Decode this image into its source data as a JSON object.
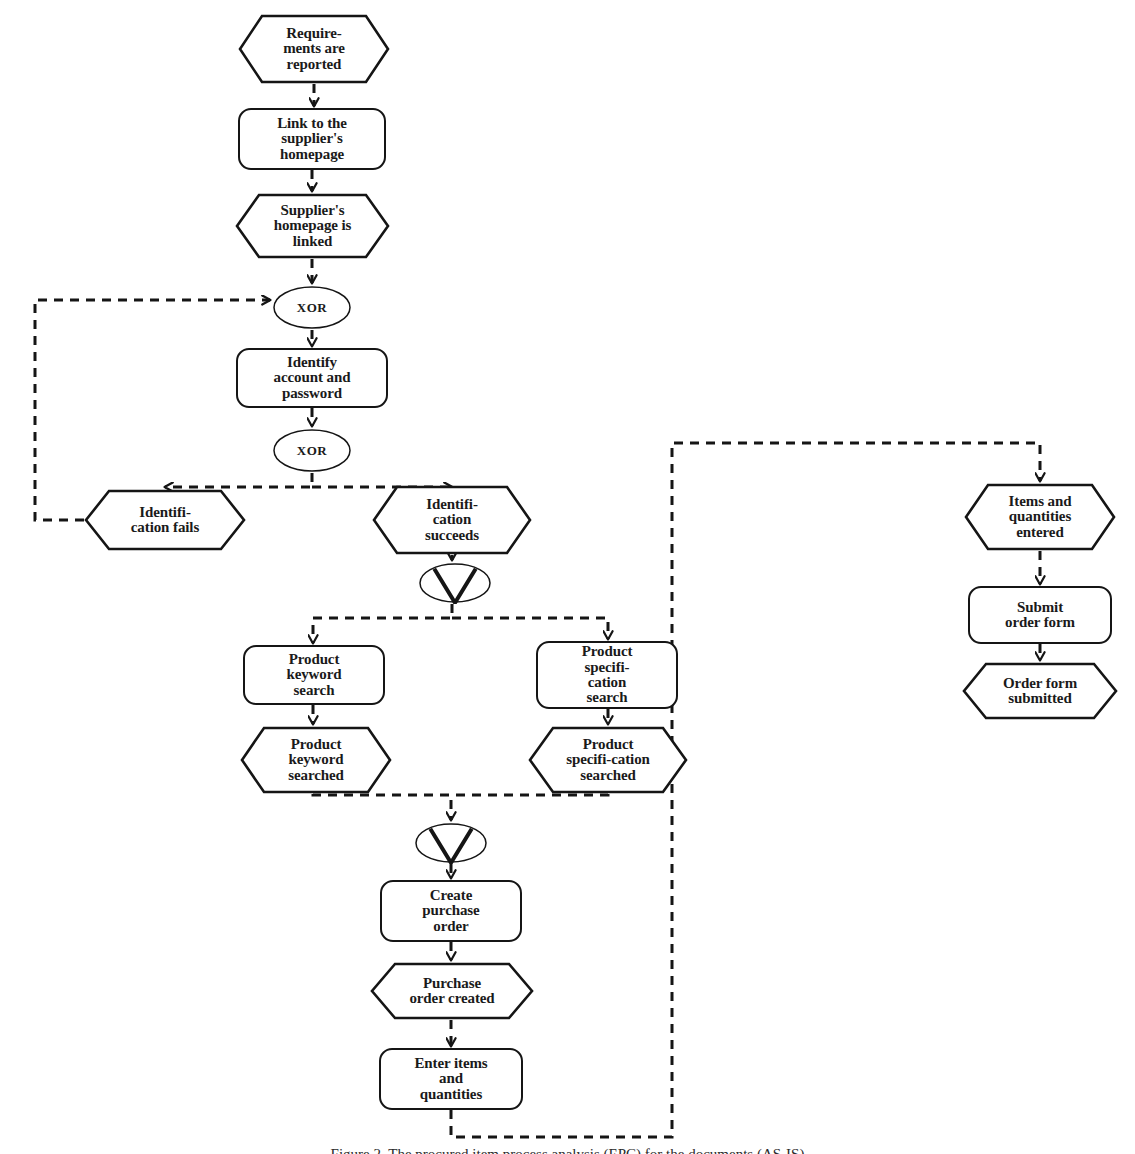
{
  "diagram": {
    "notation": "Event-driven Process Chain",
    "background_color": "#ffffff",
    "line_color": "#151515",
    "text_color": "#1a1a1a",
    "edge_style": "dashed",
    "caption": "Figure 2. The procured item process analysis (EPC) for the documents (AS-IS)"
  },
  "nodes": [
    {
      "id": "requirements_reported",
      "type": "event",
      "label": "Require-\nments are\nreported",
      "x": 238,
      "y": 14,
      "w": 152,
      "h": 70,
      "font_size": 15
    },
    {
      "id": "link_supplier_homepage",
      "type": "function",
      "label": "Link to the\nsupplier's\nhomepage",
      "x": 238,
      "y": 108,
      "w": 148,
      "h": 62,
      "font_size": 15
    },
    {
      "id": "supplier_homepage_linked",
      "type": "event",
      "label": "Supplier's\nhomepage is\nlinked",
      "x": 235,
      "y": 193,
      "w": 155,
      "h": 66,
      "font_size": 15
    },
    {
      "id": "xor_1",
      "type": "connector",
      "label": "XOR",
      "x": 272,
      "y": 285,
      "w": 80,
      "h": 45,
      "font_size": 13
    },
    {
      "id": "identify_account_password",
      "type": "function",
      "label": "Identify\naccount and\npassword",
      "x": 236,
      "y": 348,
      "w": 152,
      "h": 60,
      "font_size": 15
    },
    {
      "id": "xor_2",
      "type": "connector",
      "label": "XOR",
      "x": 272,
      "y": 428,
      "w": 80,
      "h": 45,
      "font_size": 13
    },
    {
      "id": "identification_fails",
      "type": "event",
      "label": "Identifi-\ncation fails",
      "x": 84,
      "y": 489,
      "w": 162,
      "h": 62,
      "font_size": 15
    },
    {
      "id": "identification_succeeds",
      "type": "event",
      "label": "Identifi-\ncation\nsucceeds",
      "x": 372,
      "y": 485,
      "w": 160,
      "h": 70,
      "font_size": 15
    },
    {
      "id": "or_split",
      "type": "connector",
      "label": "V",
      "x": 418,
      "y": 562,
      "w": 74,
      "h": 42,
      "font_size": 13
    },
    {
      "id": "product_keyword_search",
      "type": "function",
      "label": "Product\nkeyword\nsearch",
      "x": 243,
      "y": 645,
      "w": 142,
      "h": 60,
      "font_size": 15
    },
    {
      "id": "product_specification_search",
      "type": "function",
      "label": "Product\nspecifi-\ncation\nsearch",
      "x": 536,
      "y": 641,
      "w": 142,
      "h": 68,
      "font_size": 15
    },
    {
      "id": "product_keyword_searched",
      "type": "event",
      "label": "Product\nkeyword\nsearched",
      "x": 240,
      "y": 726,
      "w": 152,
      "h": 68,
      "font_size": 15
    },
    {
      "id": "product_specification_searched",
      "type": "event",
      "label": "Product\nspecifi-cation\nsearched",
      "x": 528,
      "y": 726,
      "w": 160,
      "h": 68,
      "font_size": 15
    },
    {
      "id": "or_join",
      "type": "connector",
      "label": "V",
      "x": 414,
      "y": 822,
      "w": 74,
      "h": 42,
      "font_size": 13
    },
    {
      "id": "create_purchase_order",
      "type": "function",
      "label": "Create\npurchase\norder",
      "x": 380,
      "y": 880,
      "w": 142,
      "h": 62,
      "font_size": 15
    },
    {
      "id": "purchase_order_created",
      "type": "event",
      "label": "Purchase\norder created",
      "x": 370,
      "y": 962,
      "w": 164,
      "h": 58,
      "font_size": 15
    },
    {
      "id": "enter_items_quantities",
      "type": "function",
      "label": "Enter items\nand\nquantities",
      "x": 379,
      "y": 1048,
      "w": 144,
      "h": 62,
      "font_size": 15
    },
    {
      "id": "items_quantities_entered",
      "type": "event",
      "label": "Items and\nquantities\nentered",
      "x": 964,
      "y": 483,
      "w": 152,
      "h": 68,
      "font_size": 15
    },
    {
      "id": "submit_order_form",
      "type": "function",
      "label": "Submit\norder form",
      "x": 968,
      "y": 586,
      "w": 144,
      "h": 58,
      "font_size": 15
    },
    {
      "id": "order_form_submitted",
      "type": "event",
      "label": "Order form\nsubmitted",
      "x": 962,
      "y": 662,
      "w": 156,
      "h": 58,
      "font_size": 15
    }
  ],
  "edges": [
    {
      "id": "e1",
      "from": "requirements_reported",
      "to": "link_supplier_homepage",
      "path": "M 314,84 L 314,106",
      "arrow": true
    },
    {
      "id": "e2",
      "from": "link_supplier_homepage",
      "to": "supplier_homepage_linked",
      "path": "M 312,170 L 312,191",
      "arrow": true
    },
    {
      "id": "e3",
      "from": "supplier_homepage_linked",
      "to": "xor_1",
      "path": "M 312,259 L 312,283",
      "arrow": true
    },
    {
      "id": "e4",
      "from": "xor_1",
      "to": "identify_account_password",
      "path": "M 312,330 L 312,346",
      "arrow": true
    },
    {
      "id": "e5",
      "from": "identify_account_password",
      "to": "xor_2",
      "path": "M 312,408 L 312,426",
      "arrow": true
    },
    {
      "id": "e6",
      "from": "xor_2",
      "to": "identification_fails",
      "path": "M 312,473 L 312,487 L 165,487",
      "arrow": true
    },
    {
      "id": "e7",
      "from": "xor_2",
      "to": "identification_succeeds",
      "path": "M 312,487 L 452,487",
      "arrow": true
    },
    {
      "id": "e8",
      "from": "identification_fails",
      "to": "xor_1",
      "path": "M 84,520 L 35,520 L 35,300 L 270,300",
      "arrow": true
    },
    {
      "id": "e9",
      "from": "identification_succeeds",
      "to": "or_split",
      "path": "M 452,555 L 452,560",
      "arrow": true
    },
    {
      "id": "e10",
      "from": "or_split",
      "to": "product_keyword_search",
      "path": "M 452,604 L 452,618 L 313,618 L 313,643",
      "arrow": true
    },
    {
      "id": "e11",
      "from": "or_split",
      "to": "product_specification_search",
      "path": "M 452,618 L 608,618 L 608,639",
      "arrow": true
    },
    {
      "id": "e12",
      "from": "product_keyword_search",
      "to": "product_keyword_searched",
      "path": "M 313,705 L 313,724",
      "arrow": true
    },
    {
      "id": "e13",
      "from": "product_specification_search",
      "to": "product_specification_searched",
      "path": "M 608,709 L 608,724",
      "arrow": true
    },
    {
      "id": "e14",
      "from": "product_keyword_searched",
      "to": "or_join",
      "path": "M 313,794 L 313,795 L 451,795 L 451,820",
      "arrow": true
    },
    {
      "id": "e15",
      "from": "product_specification_searched",
      "to": "or_join",
      "path": "M 608,794 L 608,795 L 451,795",
      "arrow": false
    },
    {
      "id": "e16",
      "from": "or_join",
      "to": "create_purchase_order",
      "path": "M 451,864 L 451,878",
      "arrow": true
    },
    {
      "id": "e17",
      "from": "create_purchase_order",
      "to": "purchase_order_created",
      "path": "M 451,942 L 451,960",
      "arrow": true
    },
    {
      "id": "e18",
      "from": "purchase_order_created",
      "to": "enter_items_quantities",
      "path": "M 451,1020 L 451,1046",
      "arrow": true
    },
    {
      "id": "e19",
      "from": "enter_items_quantities",
      "to": "items_quantities_entered",
      "path": "M 451,1110 L 451,1137 L 672,1137 L 672,443 L 1040,443 L 1040,481",
      "arrow": true
    },
    {
      "id": "e20",
      "from": "items_quantities_entered",
      "to": "submit_order_form",
      "path": "M 1040,551 L 1040,584",
      "arrow": true
    },
    {
      "id": "e21",
      "from": "submit_order_form",
      "to": "order_form_submitted",
      "path": "M 1040,644 L 1040,660",
      "arrow": true
    }
  ]
}
